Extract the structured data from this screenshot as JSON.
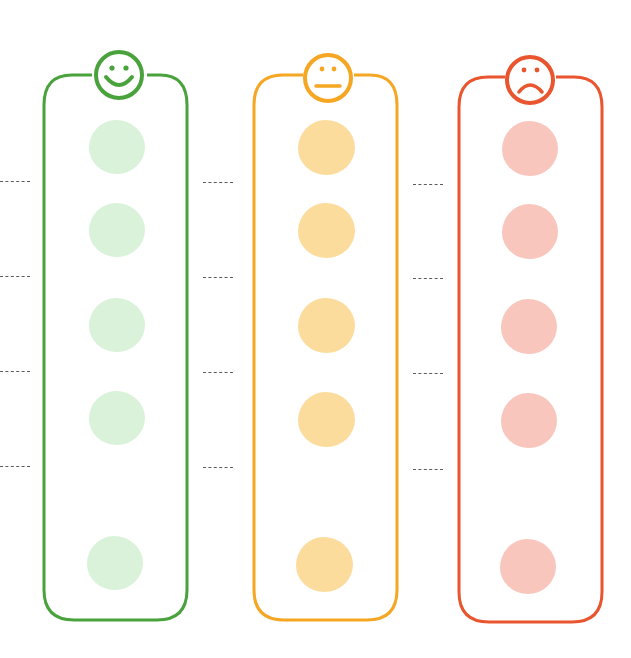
{
  "diagram": {
    "type": "mood-rating-chart",
    "columns": [
      {
        "id": "happy",
        "icon": "smiley-face-icon",
        "stroke": "#4aa23d",
        "fill": "#d9f2d9",
        "x": 42,
        "width": 148,
        "circles": 5
      },
      {
        "id": "neutral",
        "icon": "neutral-face-icon",
        "stroke": "#f5a623",
        "fill": "#fcdc9c",
        "x": 253,
        "width": 148,
        "circles": 5
      },
      {
        "id": "sad",
        "icon": "sad-face-icon",
        "stroke": "#e8552e",
        "fill": "#f9c6be",
        "x": 455,
        "width": 148,
        "circles": 5
      }
    ],
    "circle_rows_y": [
      147,
      230,
      325,
      418,
      563
    ],
    "dash_rows_y": [
      182,
      277,
      372,
      467
    ],
    "dash_x": [
      0,
      203,
      413
    ]
  }
}
